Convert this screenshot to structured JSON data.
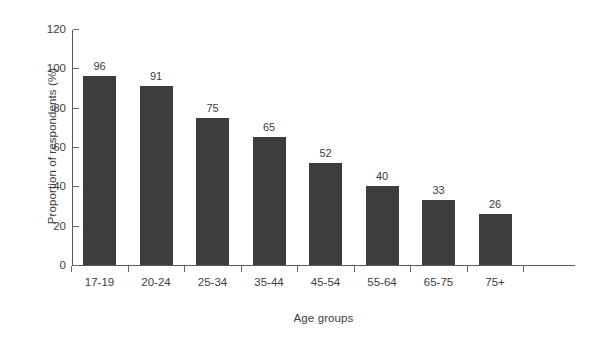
{
  "chart_data": {
    "type": "bar",
    "title": "",
    "subtitle": "",
    "xlabel": "Age groups",
    "ylabel": "Proportion of respondents (%)",
    "categories": [
      "17-19",
      "20-24",
      "25-34",
      "35-44",
      "45-54",
      "55-64",
      "65-75",
      "75+"
    ],
    "values": [
      96,
      91,
      75,
      65,
      52,
      40,
      33,
      26
    ],
    "value_labels": [
      "96",
      "91",
      "75",
      "65",
      "52",
      "40",
      "33",
      "26"
    ],
    "ylim": [
      0,
      120
    ],
    "ytick_values": [
      0,
      20,
      40,
      60,
      80,
      100,
      120
    ],
    "ytick_labels": [
      "0",
      "20",
      "40",
      "60",
      "80",
      "100",
      "120"
    ],
    "grid": false,
    "legend": null,
    "legend_position": "none",
    "annotations": [],
    "bar_color": "#3d3d3d",
    "axis_color": "#5a5a5a",
    "text_color": "#3d3d3d",
    "background_color": "#ffffff"
  }
}
